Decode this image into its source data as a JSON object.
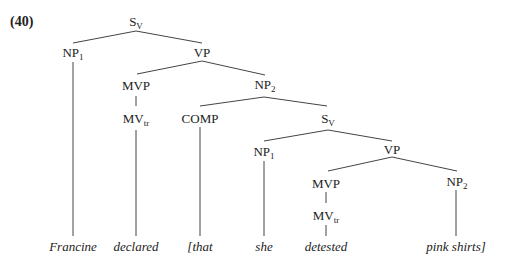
{
  "example_number": "(40)",
  "nodes": {
    "s_root": {
      "main": "S",
      "sub": "V"
    },
    "np1_top": {
      "main": "NP",
      "sub": "1"
    },
    "vp_top": {
      "main": "VP",
      "sub": ""
    },
    "mvp_top": {
      "main": "MVP",
      "sub": ""
    },
    "mv_top": {
      "main": "MV",
      "sub": "tr"
    },
    "np2_top": {
      "main": "NP",
      "sub": "2"
    },
    "comp": {
      "main": "COMP",
      "sub": ""
    },
    "s_emb": {
      "main": "S",
      "sub": "V"
    },
    "np1_emb": {
      "main": "NP",
      "sub": "1"
    },
    "vp_emb": {
      "main": "VP",
      "sub": ""
    },
    "mvp_emb": {
      "main": "MVP",
      "sub": ""
    },
    "mv_emb": {
      "main": "MV",
      "sub": "tr"
    },
    "np2_emb": {
      "main": "NP",
      "sub": "2"
    }
  },
  "leaves": [
    "Francine",
    "declared",
    "[that",
    "she",
    "detested",
    "pink shirts]"
  ]
}
